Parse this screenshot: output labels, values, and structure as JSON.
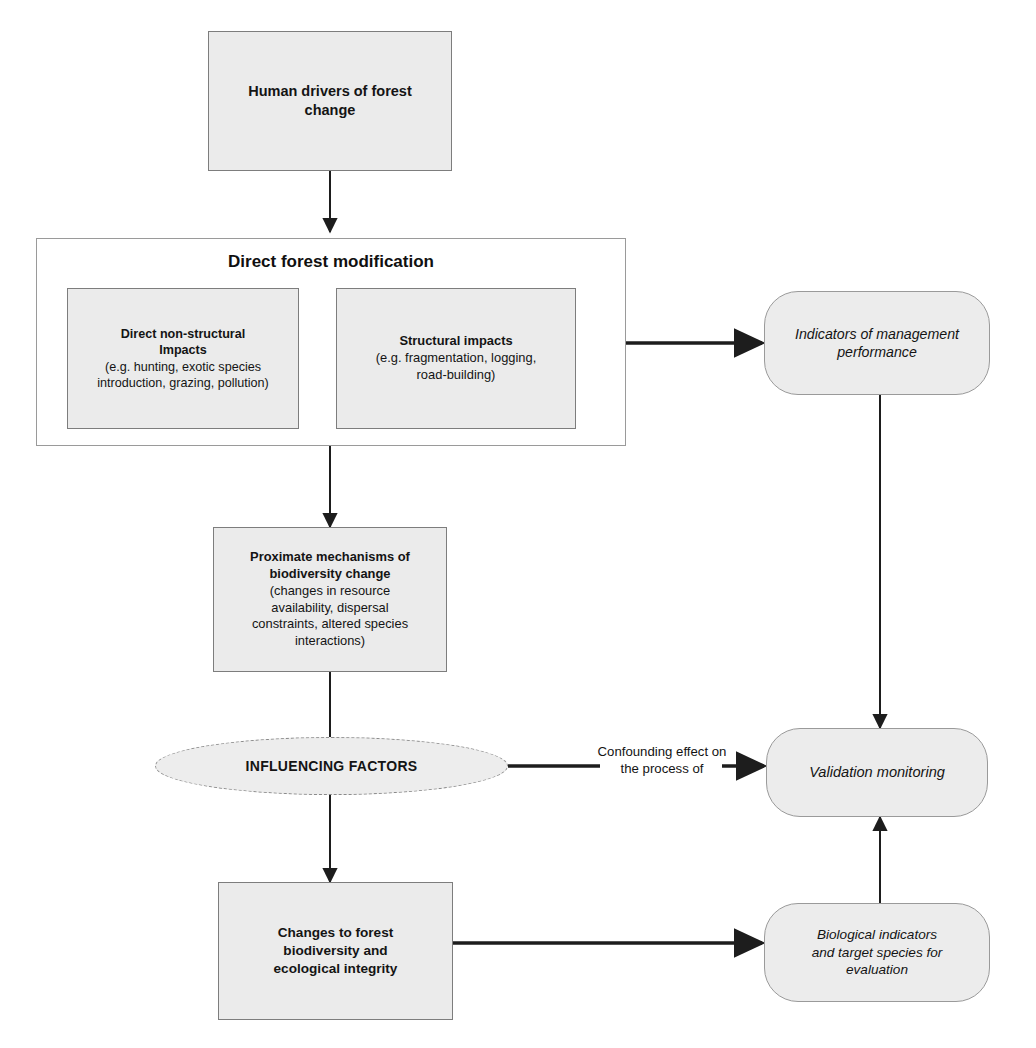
{
  "diagram": {
    "background_color": "#ffffff",
    "node_fill_color": "#ebebeb",
    "node_border_color": "#7d7d7d",
    "connector_color": "#1d1d1d"
  },
  "nodes": {
    "human_drivers": {
      "label": "Human drivers of forest\nchange",
      "shape": "rectangle"
    },
    "direct_forest_modification": {
      "heading": "Direct forest modification",
      "shape": "container"
    },
    "non_structural_impacts": {
      "title": "Direct non-structural\nImpacts",
      "detail": "(e.g. hunting, exotic species\nintroduction, grazing, pollution)",
      "shape": "rectangle"
    },
    "structural_impacts": {
      "title": "Structural impacts",
      "detail": "(e.g. fragmentation, logging,\nroad-building)",
      "shape": "rectangle"
    },
    "proximate_mechanisms": {
      "title": "Proximate mechanisms of\nbiodiversity change",
      "detail": "(changes in resource\navailability, dispersal\nconstraints, altered species\ninteractions)",
      "shape": "rectangle"
    },
    "influencing_factors": {
      "label": "INFLUENCING FACTORS",
      "shape": "ellipse"
    },
    "changes_to_forest": {
      "label": "Changes to forest\nbiodiversity and\necological integrity",
      "shape": "rectangle"
    },
    "indicators_of_management_performance": {
      "label": "Indicators of management\nperformance",
      "shape": "rounded-rectangle"
    },
    "validation_monitoring": {
      "label": "Validation monitoring",
      "shape": "rounded-rectangle"
    },
    "biological_indicators": {
      "label": "Biological indicators\nand target species for\nevaluation",
      "shape": "rounded-rectangle"
    }
  },
  "edges": {
    "confounding": {
      "label": "Confounding effect on\nthe process of"
    }
  }
}
